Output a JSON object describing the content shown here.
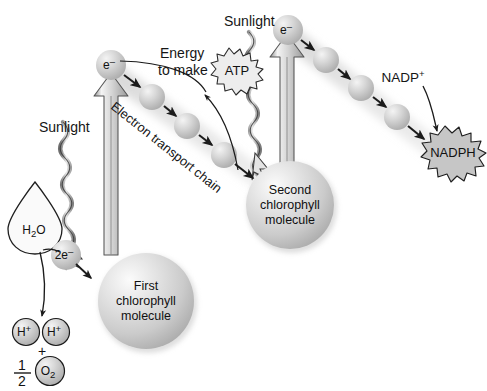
{
  "diagram": {
    "background_color": "#ffffff",
    "ink_color": "#1b1b1b",
    "sphere_fill": "#d0d0d0",
    "sphere_highlight": "#f2f2f2",
    "glow_color": "#d9d9d9",
    "width": 487,
    "height": 391
  },
  "labels": {
    "sunlight_left": "Sunlight",
    "sunlight_right": "Sunlight",
    "energy_line1": "Energy",
    "energy_line2": "to make",
    "atp": "ATP",
    "nadp_plus": "NADP",
    "nadp_plus_sup": "+",
    "nadph": "NADPH",
    "electron_transport_chain": "Electron transport chain",
    "electron_symbol": "e",
    "electron_symbol_sup": "–",
    "two_electrons": "2e",
    "two_electrons_sup": "–",
    "water_main": "H",
    "water_sub": "2",
    "water_tail": "O",
    "proton": "H",
    "proton_sup": "+",
    "plus_sign": "+",
    "fraction_numerator": "1",
    "fraction_denominator": "2",
    "oxygen_main": "O",
    "oxygen_sub": "2"
  },
  "chlorophyll": {
    "first": {
      "line1": "First",
      "line2": "chlorophyll",
      "line3": "molecule"
    },
    "second": {
      "line1": "Second",
      "line2": "chlorophyll",
      "line3": "molecule"
    }
  },
  "structures": {
    "first_chain_carriers": 3,
    "second_chain_carriers": 3,
    "excitation_arrows": 2,
    "sunlight_squiggles": 2
  }
}
